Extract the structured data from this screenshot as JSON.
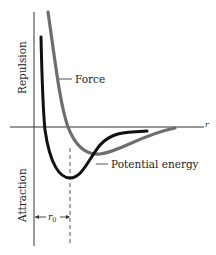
{
  "diagram": {
    "labels": {
      "y_positive": "Repulsion",
      "y_negative": "Attraction",
      "x_axis": "r",
      "force": "Force",
      "potential_energy": "Potential energy",
      "r0_main": "r",
      "r0_sub": "0"
    },
    "colors": {
      "force_curve": "#6e6e6e",
      "potential_curve": "#111111",
      "axes": "#333333",
      "text": "#222222"
    },
    "curves": [
      {
        "name": "Force",
        "style": "gray thick line",
        "description": "steep repulsion, crosses r-axis, shallow minimum, approaches zero"
      },
      {
        "name": "Potential energy",
        "style": "black thick line",
        "description": "steep repulsion, deep minimum at r0, approaches zero"
      }
    ]
  }
}
